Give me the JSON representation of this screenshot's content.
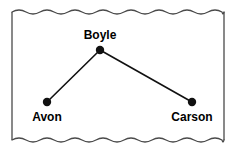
{
  "figure": {
    "kind": "node-link-diagram",
    "background_color": "#ffffff",
    "frame": {
      "style": "torn-paper",
      "border_color": "#4a4a4a",
      "left": 12,
      "top": 12,
      "right": 224,
      "bottom": 140,
      "top_edge": "wavy",
      "bottom_edge": "wavy",
      "left_edge": "straight",
      "right_edge": "straight",
      "wave_period": 14,
      "wave_amplitude": 2
    },
    "nodes": [
      {
        "id": "boyle",
        "label": "Boyle",
        "x": 100,
        "y": 50,
        "radius": 4.2,
        "color": "#111111",
        "label_x": 100,
        "label_y": 39,
        "label_anchor": "middle",
        "label_position": "above"
      },
      {
        "id": "avon",
        "label": "Avon",
        "x": 47,
        "y": 102,
        "radius": 4.2,
        "color": "#111111",
        "label_x": 47,
        "label_y": 121,
        "label_anchor": "middle",
        "label_position": "below"
      },
      {
        "id": "carson",
        "label": "Carson",
        "x": 192,
        "y": 102,
        "radius": 4.2,
        "color": "#111111",
        "label_x": 192,
        "label_y": 121,
        "label_anchor": "middle",
        "label_position": "below"
      }
    ],
    "edges": [
      {
        "id": "boyle-avon",
        "from": "boyle",
        "to": "avon",
        "x1": 100,
        "y1": 50,
        "x2": 47,
        "y2": 102,
        "color": "#111111"
      },
      {
        "id": "boyle-carson",
        "from": "boyle",
        "to": "carson",
        "x1": 100,
        "y1": 50,
        "x2": 192,
        "y2": 102,
        "color": "#111111"
      }
    ]
  }
}
